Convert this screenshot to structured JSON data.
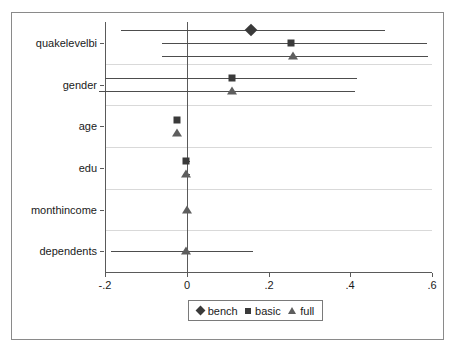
{
  "chart_data": {
    "type": "scatter",
    "title": "",
    "subtitle": "",
    "xlabel": "",
    "ylabel": "",
    "plot_kind": "coefficient-plot",
    "grid": true,
    "xlim": [
      -0.2,
      0.6
    ],
    "xticks": [
      -0.2,
      0,
      0.2,
      0.4,
      0.6
    ],
    "xtick_labels": [
      "-.2",
      "0",
      ".2",
      ".4",
      ".6"
    ],
    "categories": [
      "quakelevelbi",
      "gender",
      "age",
      "edu",
      "monthincome",
      "dependents"
    ],
    "reference_line": 0,
    "legend": {
      "position": "bottom-center",
      "entries": [
        {
          "name": "bench",
          "marker": "diamond",
          "color": "#3a3a3a"
        },
        {
          "name": "basic",
          "marker": "square",
          "color": "#3a3a3a"
        },
        {
          "name": "full",
          "marker": "triangle",
          "color": "#5e5e5e"
        }
      ]
    },
    "series": [
      {
        "name": "bench",
        "marker": "diamond",
        "points": [
          {
            "category": "quakelevelbi",
            "estimate": 0.156,
            "ci_low": -0.161,
            "ci_high": 0.486
          },
          {
            "category": "gender",
            "estimate": null,
            "ci_low": null,
            "ci_high": null
          },
          {
            "category": "age",
            "estimate": null,
            "ci_low": null,
            "ci_high": null
          },
          {
            "category": "edu",
            "estimate": null,
            "ci_low": null,
            "ci_high": null
          },
          {
            "category": "monthincome",
            "estimate": null,
            "ci_low": null,
            "ci_high": null
          },
          {
            "category": "dependents",
            "estimate": null,
            "ci_low": null,
            "ci_high": null
          }
        ]
      },
      {
        "name": "basic",
        "marker": "square",
        "points": [
          {
            "category": "quakelevelbi",
            "estimate": 0.256,
            "ci_low": -0.061,
            "ci_high": 0.588
          },
          {
            "category": "gender",
            "estimate": 0.11,
            "ci_low": -0.2,
            "ci_high": 0.417
          },
          {
            "category": "age",
            "estimate": -0.024,
            "ci_low": -0.029,
            "ci_high": -0.019
          },
          {
            "category": "edu",
            "estimate": -0.002,
            "ci_low": -0.01,
            "ci_high": 0.007
          },
          {
            "category": "monthincome",
            "estimate": null,
            "ci_low": null,
            "ci_high": null
          },
          {
            "category": "dependents",
            "estimate": null,
            "ci_low": null,
            "ci_high": null
          }
        ]
      },
      {
        "name": "full",
        "marker": "triangle",
        "points": [
          {
            "category": "quakelevelbi",
            "estimate": 0.261,
            "ci_low": -0.061,
            "ci_high": 0.59
          },
          {
            "category": "gender",
            "estimate": 0.11,
            "ci_low": -0.215,
            "ci_high": 0.412
          },
          {
            "category": "age",
            "estimate": -0.024,
            "ci_low": -0.029,
            "ci_high": -0.019
          },
          {
            "category": "edu",
            "estimate": -0.002,
            "ci_low": -0.01,
            "ci_high": 0.007
          },
          {
            "category": "monthincome",
            "estimate": 0.0,
            "ci_low": -0.002,
            "ci_high": 0.002
          },
          {
            "category": "dependents",
            "estimate": -0.002,
            "ci_low": -0.185,
            "ci_high": 0.163
          }
        ]
      }
    ]
  }
}
